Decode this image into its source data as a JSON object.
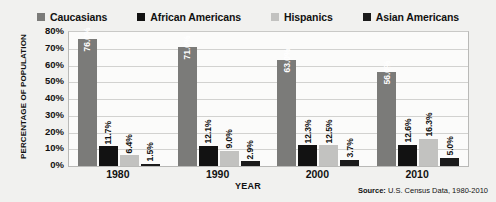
{
  "chart_data": {
    "type": "bar",
    "title": "",
    "xlabel": "YEAR",
    "ylabel": "PERCENTAGE OF POPULATION",
    "ylim": [
      0,
      80
    ],
    "ytick_labels": [
      "80%",
      "70%",
      "60%",
      "50%",
      "40%",
      "30%",
      "20%",
      "10%",
      "0%"
    ],
    "ytick_values": [
      80,
      70,
      60,
      50,
      40,
      30,
      20,
      10,
      0
    ],
    "grid": true,
    "legend_position": "top-center",
    "categories": [
      "1980",
      "1990",
      "2000",
      "2010"
    ],
    "series": [
      {
        "name": "Caucasians",
        "color": "#7b7b79",
        "values": [
          76.0,
          71.0,
          63.0,
          56.0
        ],
        "labels": [
          "76.0%",
          "71.0%",
          "63.0%",
          "56.0%"
        ]
      },
      {
        "name": "African Americans",
        "color": "#121212",
        "values": [
          11.7,
          12.1,
          12.3,
          12.6
        ],
        "labels": [
          "11.7%",
          "12.1%",
          "12.3%",
          "12.6%"
        ]
      },
      {
        "name": "Hispanics",
        "color": "#c2c2c0",
        "values": [
          6.4,
          9.0,
          12.5,
          16.3
        ],
        "labels": [
          "6.4%",
          "9.0%",
          "12.5%",
          "16.3%"
        ]
      },
      {
        "name": "Asian Americans",
        "color": "#1b1b1b",
        "values": [
          1.5,
          2.9,
          3.7,
          5.0
        ],
        "labels": [
          "1.5%",
          "2.9%",
          "3.7%",
          "5.0%"
        ]
      }
    ]
  },
  "legend": {
    "items": [
      {
        "label": "Caucasians",
        "color": "#7b7b79"
      },
      {
        "label": "African Americans",
        "color": "#121212"
      },
      {
        "label": "Hispanics",
        "color": "#c2c2c0"
      },
      {
        "label": "Asian Americans",
        "color": "#1b1b1b"
      }
    ]
  },
  "source": {
    "label": "Source:",
    "text": " U.S. Census Data, 1980-2010"
  }
}
